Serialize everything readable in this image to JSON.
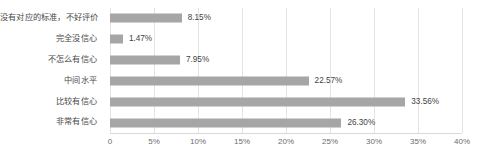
{
  "chart_data": {
    "type": "bar",
    "orientation": "horizontal",
    "title": "",
    "xlabel": "",
    "ylabel": "",
    "categories": [
      "没有对应的标准，不好评价",
      "完全没信心",
      "不怎么有信心",
      "中间水平",
      "比较有信心",
      "非常有信心"
    ],
    "values": [
      8.15,
      1.47,
      7.95,
      22.57,
      33.56,
      26.3
    ],
    "value_labels": [
      "8.15%",
      "1.47%",
      "7.95%",
      "22.57%",
      "33.56%",
      "26.30%"
    ],
    "xlim": [
      0,
      40
    ],
    "xticks": [
      0,
      5,
      10,
      15,
      20,
      25,
      30,
      35,
      40
    ],
    "xtick_labels": [
      "0",
      "5%",
      "10%",
      "15%",
      "20%",
      "25%",
      "30%",
      "35%",
      "40%"
    ],
    "grid": "vertical",
    "legend": null,
    "bar_color": "#a6a6a6",
    "gridline_color": "#e4e4e4",
    "label_color": "#4a4a4a",
    "background": "#ffffff"
  }
}
